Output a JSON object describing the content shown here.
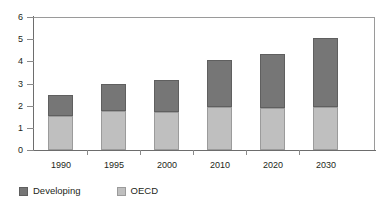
{
  "chart_data": {
    "type": "bar",
    "stacked": true,
    "title": "",
    "subtitle": "",
    "xlabel": "",
    "ylabel": "",
    "categories": [
      "1990",
      "1995",
      "2000",
      "2010",
      "2020",
      "2030"
    ],
    "series": [
      {
        "name": "OECD",
        "color": "#bfbfbf",
        "values": [
          1.55,
          1.75,
          1.7,
          1.95,
          1.88,
          1.95
        ]
      },
      {
        "name": "Developing",
        "color": "#767676",
        "values": [
          0.95,
          1.25,
          1.45,
          2.1,
          2.47,
          3.1
        ]
      }
    ],
    "totals": [
      2.5,
      3.0,
      3.15,
      4.05,
      4.35,
      5.05
    ],
    "stack_order": [
      "OECD",
      "Developing"
    ],
    "ylim": [
      0,
      6
    ],
    "yticks": [
      "0",
      "1",
      "2",
      "3",
      "4",
      "5",
      "6"
    ],
    "ytick_values": [
      0,
      1,
      2,
      3,
      4,
      5,
      6
    ],
    "grid": false,
    "legend_position": "bottom-left",
    "legend": [
      {
        "label": "Developing",
        "color": "#767676"
      },
      {
        "label": "OECD",
        "color": "#bfbfbf"
      }
    ]
  }
}
